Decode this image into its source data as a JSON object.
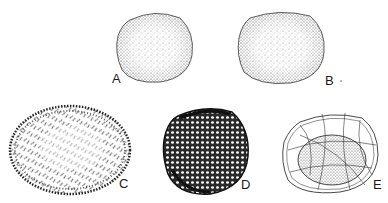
{
  "figure": {
    "specimens": [
      {
        "id": "A",
        "label": "A",
        "description": "round stippled grain"
      },
      {
        "id": "B",
        "label": "B",
        "description": "oval stippled grain"
      },
      {
        "id": "C",
        "label": "C",
        "description": "spiny oval grain"
      },
      {
        "id": "D",
        "label": "D",
        "description": "reticulate dense grain"
      },
      {
        "id": "E",
        "label": "E",
        "description": "grain with netted outer coat"
      }
    ],
    "colors": {
      "ink": "#1a1a1a",
      "background": "#ffffff"
    }
  }
}
